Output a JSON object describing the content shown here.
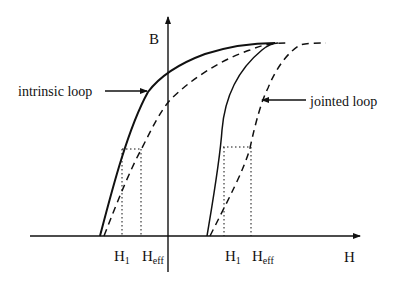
{
  "diagram": {
    "axes": {
      "y_label": "B",
      "x_label": "H"
    },
    "annotations": {
      "intrinsic": "intrinsic loop",
      "jointed": "jointed loop"
    },
    "left_markers": {
      "h1": "H",
      "h1_sub": "1",
      "heff": "H",
      "heff_sub": "eff"
    },
    "right_markers": {
      "h1": "H",
      "h1_sub": "1",
      "heff": "H",
      "heff_sub": "eff"
    },
    "colors": {
      "ink": "#111111",
      "background": "#ffffff"
    }
  }
}
